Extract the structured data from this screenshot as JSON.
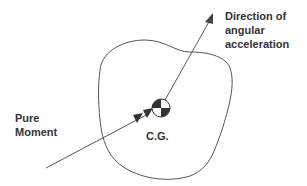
{
  "diagram": {
    "labels": {
      "direction_line1": "Direction of",
      "direction_line2": "angular",
      "direction_line3": "acceleration",
      "moment_line1": "Pure",
      "moment_line2": "Moment",
      "cg": "C.G."
    },
    "colors": {
      "stroke": "#555555",
      "fill_dark": "#333333",
      "text": "#333333"
    }
  }
}
